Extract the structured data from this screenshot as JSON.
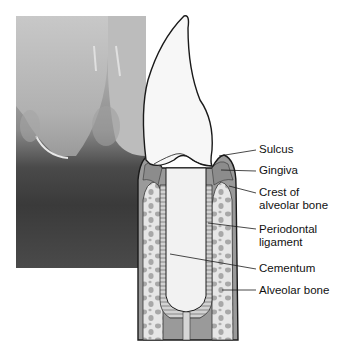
{
  "figure": {
    "photo_description": "Grayscale photo of lower incisors and gingiva",
    "labels": [
      {
        "id": "sulcus",
        "text": "Sulcus"
      },
      {
        "id": "gingiva",
        "text": "Gingiva"
      },
      {
        "id": "crest",
        "line1": "Crest of",
        "line2": "alveolar bone"
      },
      {
        "id": "periodontal",
        "line1": "Periodontal",
        "line2": "ligament"
      },
      {
        "id": "cementum",
        "text": "Cementum"
      },
      {
        "id": "alveolar",
        "text": "Alveolar bone"
      }
    ]
  },
  "colors": {
    "enamel": "#f7f7f7",
    "outline": "#1a1a1a",
    "gingiva": "#9a9a9a",
    "bone": "#e6e6e6",
    "trabeculae": "#a8a8a8",
    "ligament": "#bdbdbd"
  }
}
